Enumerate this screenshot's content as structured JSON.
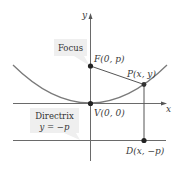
{
  "diagram": {
    "axes": {
      "x_label": "x",
      "y_label": "y"
    },
    "points": {
      "focus": "F(0, p)",
      "point": "P(x, y)",
      "vertex": "V(0, 0)",
      "directrix_point": "D(x, −p)"
    },
    "callouts": {
      "focus": "Focus",
      "directrix_title": "Directrix",
      "directrix_eq": "y = −p"
    },
    "colors": {
      "curve": "#7a7a7a",
      "axis": "#6a6a6a",
      "point": "#222222",
      "callout_bg": "#efefef"
    }
  }
}
